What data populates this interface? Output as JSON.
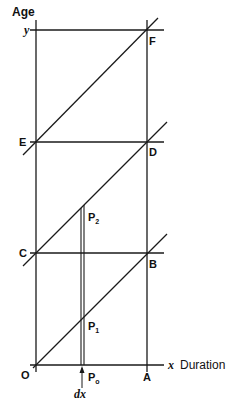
{
  "diagram": {
    "axes": {
      "y_axis_label": "Age",
      "x_axis_label": "Duration",
      "y_value_label": "y",
      "x_value_label": "x",
      "origin_label": "O"
    },
    "points": {
      "A": "A",
      "B": "B",
      "C": "C",
      "D": "D",
      "E": "E",
      "F": "F",
      "P0": "P",
      "P0_sub": "o",
      "P1": "P",
      "P1_sub": "1",
      "P2": "P",
      "P2_sub": "2"
    },
    "increment_label": "dx",
    "colors": {
      "line": "#1a1a1a",
      "background": "#ffffff"
    }
  }
}
